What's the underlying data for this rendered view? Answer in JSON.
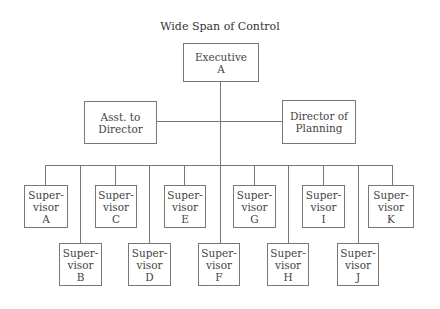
{
  "title": "Wide Span of Control",
  "executive": {
    "line1": "Executive",
    "line2": "A"
  },
  "staff": [
    {
      "line1": "Asst. to",
      "line2": "Director"
    },
    {
      "line1": "Director of",
      "line2": "Planning"
    }
  ],
  "supervisors": [
    {
      "line1": "Super-",
      "line2": "visor",
      "line3": "A"
    },
    {
      "line1": "Super-",
      "line2": "visor",
      "line3": "B"
    },
    {
      "line1": "Super-",
      "line2": "visor",
      "line3": "C"
    },
    {
      "line1": "Super-",
      "line2": "visor",
      "line3": "D"
    },
    {
      "line1": "Super-",
      "line2": "visor",
      "line3": "E"
    },
    {
      "line1": "Super-",
      "line2": "visor",
      "line3": "F"
    },
    {
      "line1": "Super-",
      "line2": "visor",
      "line3": "G"
    },
    {
      "line1": "Super-",
      "line2": "visor",
      "line3": "H"
    },
    {
      "line1": "Super-",
      "line2": "visor",
      "line3": "I"
    },
    {
      "line1": "Super-",
      "line2": "visor",
      "line3": "J"
    },
    {
      "line1": "Super-",
      "line2": "visor",
      "line3": "K"
    }
  ]
}
